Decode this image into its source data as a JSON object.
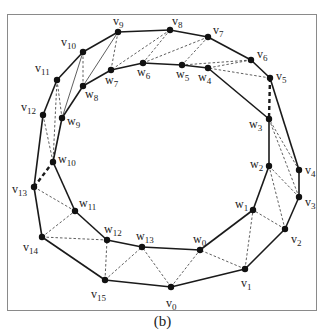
{
  "figure": {
    "caption": "(b)",
    "colors": {
      "line": "#1a1a1a",
      "frame": "#8a8a8a",
      "node": "#111111"
    }
  },
  "nodes": [
    {
      "id": "v0",
      "base": "v",
      "sub": "0",
      "x": 171,
      "y": 287,
      "lx": -5,
      "ly": 20
    },
    {
      "id": "v1",
      "base": "v",
      "sub": "1",
      "x": 245,
      "y": 269,
      "lx": -4,
      "ly": 18
    },
    {
      "id": "v2",
      "base": "v",
      "sub": "2",
      "x": 285,
      "y": 229,
      "lx": 6,
      "ly": 14
    },
    {
      "id": "v3",
      "base": "v",
      "sub": "3",
      "x": 299,
      "y": 197,
      "lx": 6,
      "ly": 9
    },
    {
      "id": "v4",
      "base": "v",
      "sub": "4",
      "x": 299,
      "y": 170,
      "lx": 6,
      "ly": 4
    },
    {
      "id": "v5",
      "base": "v",
      "sub": "5",
      "x": 270,
      "y": 78,
      "lx": 6,
      "ly": 2
    },
    {
      "id": "v6",
      "base": "v",
      "sub": "6",
      "x": 251,
      "y": 60,
      "lx": 6,
      "ly": -2
    },
    {
      "id": "v7",
      "base": "v",
      "sub": "7",
      "x": 208,
      "y": 37,
      "lx": 5,
      "ly": -3
    },
    {
      "id": "v8",
      "base": "v",
      "sub": "8",
      "x": 170,
      "y": 30,
      "lx": 2,
      "ly": -5
    },
    {
      "id": "v9",
      "base": "v",
      "sub": "9",
      "x": 118,
      "y": 32,
      "lx": -5,
      "ly": -7
    },
    {
      "id": "v10",
      "base": "v",
      "sub": "10",
      "x": 83,
      "y": 52,
      "lx": -22,
      "ly": -6
    },
    {
      "id": "v11",
      "base": "v",
      "sub": "11",
      "x": 57,
      "y": 80,
      "lx": -22,
      "ly": -8
    },
    {
      "id": "v12",
      "base": "v",
      "sub": "12",
      "x": 43,
      "y": 115,
      "lx": -22,
      "ly": -4
    },
    {
      "id": "v13",
      "base": "v",
      "sub": "13",
      "x": 34,
      "y": 187,
      "lx": -22,
      "ly": 6
    },
    {
      "id": "v14",
      "base": "v",
      "sub": "14",
      "x": 42,
      "y": 237,
      "lx": -19,
      "ly": 14
    },
    {
      "id": "v15",
      "base": "v",
      "sub": "15",
      "x": 105,
      "y": 280,
      "lx": -14,
      "ly": 18
    },
    {
      "id": "w0",
      "base": "w",
      "sub": "0",
      "x": 200,
      "y": 250,
      "lx": -7,
      "ly": -7
    },
    {
      "id": "w1",
      "base": "w",
      "sub": "1",
      "x": 253,
      "y": 210,
      "lx": -18,
      "ly": -2
    },
    {
      "id": "w2",
      "base": "w",
      "sub": "2",
      "x": 269,
      "y": 166,
      "lx": -19,
      "ly": 2
    },
    {
      "id": "w3",
      "base": "w",
      "sub": "3",
      "x": 269,
      "y": 119,
      "lx": -20,
      "ly": 9
    },
    {
      "id": "w4",
      "base": "w",
      "sub": "4",
      "x": 208,
      "y": 68,
      "lx": -10,
      "ly": 13
    },
    {
      "id": "w5",
      "base": "w",
      "sub": "5",
      "x": 182,
      "y": 65,
      "lx": -6,
      "ly": 13
    },
    {
      "id": "w6",
      "base": "w",
      "sub": "6",
      "x": 143,
      "y": 63,
      "lx": -6,
      "ly": 13
    },
    {
      "id": "w7",
      "base": "w",
      "sub": "7",
      "x": 111,
      "y": 70,
      "lx": -6,
      "ly": 14
    },
    {
      "id": "w8",
      "base": "w",
      "sub": "8",
      "x": 83,
      "y": 86,
      "lx": 2,
      "ly": 12
    },
    {
      "id": "w9",
      "base": "w",
      "sub": "9",
      "x": 62,
      "y": 118,
      "lx": 5,
      "ly": 7
    },
    {
      "id": "w10",
      "base": "w",
      "sub": "10",
      "x": 53,
      "y": 162,
      "lx": 5,
      "ly": 1
    },
    {
      "id": "w11",
      "base": "w",
      "sub": "11",
      "x": 75,
      "y": 211,
      "lx": 4,
      "ly": -4
    },
    {
      "id": "w12",
      "base": "w",
      "sub": "12",
      "x": 107,
      "y": 240,
      "lx": -3,
      "ly": -7
    },
    {
      "id": "w13",
      "base": "w",
      "sub": "13",
      "x": 142,
      "y": 247,
      "lx": -6,
      "ly": -7
    }
  ],
  "edges": {
    "outer_solid": [
      [
        "v0",
        "v1"
      ],
      [
        "v1",
        "v2"
      ],
      [
        "v2",
        "v3"
      ],
      [
        "v3",
        "v4"
      ],
      [
        "v4",
        "v5"
      ],
      [
        "v5",
        "v6"
      ],
      [
        "v6",
        "v7"
      ],
      [
        "v7",
        "v8"
      ],
      [
        "v8",
        "v9"
      ],
      [
        "v9",
        "v10"
      ],
      [
        "v10",
        "v11"
      ],
      [
        "v11",
        "v12"
      ],
      [
        "v12",
        "v13"
      ],
      [
        "v13",
        "v14"
      ],
      [
        "v14",
        "v15"
      ],
      [
        "v15",
        "v0"
      ]
    ],
    "inner_solid": [
      [
        "w0",
        "w1"
      ],
      [
        "w1",
        "w2"
      ],
      [
        "w2",
        "w3"
      ],
      [
        "w3",
        "w4"
      ],
      [
        "w4",
        "w5"
      ],
      [
        "w5",
        "w6"
      ],
      [
        "w6",
        "w7"
      ],
      [
        "w7",
        "w8"
      ],
      [
        "w8",
        "w9"
      ],
      [
        "w9",
        "w10"
      ],
      [
        "w10",
        "w11"
      ],
      [
        "w11",
        "w12"
      ],
      [
        "w12",
        "w13"
      ],
      [
        "w13",
        "w0"
      ]
    ],
    "thin_solid": [
      [
        "w8",
        "v9"
      ],
      [
        "w9",
        "v10"
      ]
    ],
    "dashed": [
      [
        "v1",
        "w0"
      ],
      [
        "v1",
        "w1"
      ],
      [
        "v2",
        "w1"
      ],
      [
        "v2",
        "w2"
      ],
      [
        "v3",
        "w2"
      ],
      [
        "v3",
        "w3"
      ],
      [
        "v4",
        "w3"
      ],
      [
        "v0",
        "w0"
      ],
      [
        "v0",
        "w13"
      ],
      [
        "v15",
        "w13"
      ],
      [
        "v15",
        "w12"
      ],
      [
        "v14",
        "w12"
      ],
      [
        "v14",
        "w11"
      ],
      [
        "v13",
        "w11"
      ],
      [
        "v12",
        "w10"
      ],
      [
        "v11",
        "w10"
      ],
      [
        "v11",
        "w9"
      ],
      [
        "v10",
        "w8"
      ],
      [
        "v9",
        "w7"
      ],
      [
        "v8",
        "w7"
      ],
      [
        "v8",
        "w6"
      ],
      [
        "v7",
        "w6"
      ],
      [
        "v7",
        "w5"
      ],
      [
        "v6",
        "w5"
      ],
      [
        "v6",
        "w4"
      ],
      [
        "v5",
        "w4"
      ]
    ],
    "thick_dashed": [
      [
        "v5",
        "w3"
      ],
      [
        "v13",
        "w10"
      ]
    ]
  }
}
